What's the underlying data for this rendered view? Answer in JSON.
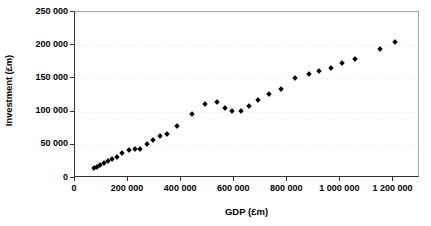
{
  "chart_data": {
    "type": "scatter",
    "title": "",
    "xlabel": "GDP (£m)",
    "ylabel": "Investment (£m)",
    "xlim": [
      0,
      1300000
    ],
    "ylim": [
      0,
      250000
    ],
    "grid": true,
    "legend": null,
    "marker": "filled-diamond",
    "marker_color": "#000000",
    "xticks": [
      0,
      200000,
      400000,
      600000,
      800000,
      1000000,
      1200000
    ],
    "xtick_labels": [
      "0",
      "200 000",
      "400 000",
      "600 000",
      "800 000",
      "1 000 000",
      "1 200 000"
    ],
    "yticks": [
      0,
      50000,
      100000,
      150000,
      200000,
      250000
    ],
    "ytick_labels": [
      "0",
      "50 000",
      "100 000",
      "150 000",
      "200 000",
      "250 000"
    ],
    "series": [
      {
        "name": "Investment vs GDP",
        "points": [
          [
            70000,
            14500
          ],
          [
            82000,
            17000
          ],
          [
            95000,
            19500
          ],
          [
            110000,
            22500
          ],
          [
            124000,
            25500
          ],
          [
            140000,
            28000
          ],
          [
            158000,
            31500
          ],
          [
            178000,
            37500
          ],
          [
            205000,
            42500
          ],
          [
            225000,
            43000
          ],
          [
            246000,
            43500
          ],
          [
            272000,
            50500
          ],
          [
            295000,
            57500
          ],
          [
            320000,
            63000
          ],
          [
            348000,
            66500
          ],
          [
            383000,
            79000
          ],
          [
            440000,
            96500
          ],
          [
            490000,
            111000
          ],
          [
            535000,
            114000
          ],
          [
            565000,
            105000
          ],
          [
            590000,
            100500
          ],
          [
            625000,
            101000
          ],
          [
            655000,
            108500
          ],
          [
            690000,
            118000
          ],
          [
            730000,
            126500
          ],
          [
            775000,
            133500
          ],
          [
            830000,
            151000
          ],
          [
            880000,
            156000
          ],
          [
            920000,
            161500
          ],
          [
            965000,
            165500
          ],
          [
            1005000,
            173000
          ],
          [
            1055000,
            178500
          ],
          [
            1150000,
            195000
          ],
          [
            1205000,
            205000
          ]
        ]
      }
    ]
  },
  "axes": {
    "x_title": "GDP (£m)",
    "y_title": "Investment (£m)"
  }
}
